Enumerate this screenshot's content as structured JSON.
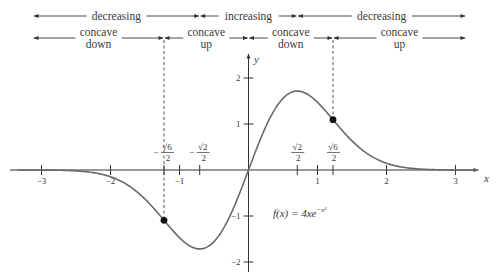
{
  "chart_data": {
    "type": "line",
    "title": "",
    "function": "f(x) = 4x e^{-x^2}",
    "xlabel": "x",
    "ylabel": "y",
    "xlim": [
      -3.3,
      3.3
    ],
    "ylim": [
      -2.2,
      2.4
    ],
    "grid": false,
    "x_ticks": [
      -3,
      -2,
      -1,
      1,
      2,
      3
    ],
    "y_ticks": [
      -2,
      -1,
      1,
      2
    ],
    "x_tick_labels": [
      "−3",
      "−2",
      "−1",
      "1",
      "2",
      "3"
    ],
    "y_tick_labels": [
      "−2",
      "−1",
      "1",
      "2"
    ],
    "special_x_ticks": [
      {
        "value": -1.2247,
        "label_num": "√6",
        "label_den": "2",
        "sign": "−"
      },
      {
        "value": -0.7071,
        "label_num": "√2",
        "label_den": "2",
        "sign": "−"
      },
      {
        "value": 0.7071,
        "label_num": "√2",
        "label_den": "2",
        "sign": ""
      },
      {
        "value": 1.2247,
        "label_num": "√6",
        "label_den": "2",
        "sign": ""
      }
    ],
    "inflection_points": [
      {
        "x": -1.2247,
        "y": -1.093
      },
      {
        "x": 1.2247,
        "y": 1.093
      }
    ],
    "extrema": [
      {
        "x": -0.7071,
        "y": -1.7155,
        "kind": "min"
      },
      {
        "x": 0.7071,
        "y": 1.7155,
        "kind": "max"
      }
    ],
    "sample_points": {
      "x": [
        -3,
        -2.5,
        -2,
        -1.5,
        -1.2247,
        -1,
        -0.7071,
        -0.5,
        0,
        0.5,
        0.7071,
        1,
        1.2247,
        1.5,
        2,
        2.5,
        3
      ],
      "y": [
        -0.0015,
        -0.0193,
        -0.1465,
        -0.6324,
        -1.093,
        -1.4715,
        -1.7155,
        -1.5576,
        0,
        1.5576,
        1.7155,
        1.4715,
        1.093,
        0.6324,
        0.1465,
        0.0193,
        0.0015
      ]
    },
    "annotations": {
      "function_label": "f(x) = 4xe",
      "function_label_exp": "−x²",
      "monotonicity": [
        {
          "label": "decreasing",
          "from": -3.3,
          "to": -0.7071
        },
        {
          "label": "increasing",
          "from": -0.7071,
          "to": 0.7071
        },
        {
          "label": "decreasing",
          "from": 0.7071,
          "to": 3.3
        }
      ],
      "concavity": [
        {
          "label_line1": "concave",
          "label_line2": "down",
          "from": -3.3,
          "to": -1.2247
        },
        {
          "label_line1": "concave",
          "label_line2": "up",
          "from": -1.2247,
          "to": 0
        },
        {
          "label_line1": "concave",
          "label_line2": "down",
          "from": 0,
          "to": 1.2247
        },
        {
          "label_line1": "concave",
          "label_line2": "up",
          "from": 1.2247,
          "to": 3.3
        }
      ]
    }
  },
  "colors": {
    "axis": "#333333",
    "curve": "#6a6a6a",
    "text": "#3a3a3a",
    "point": "#111111"
  }
}
